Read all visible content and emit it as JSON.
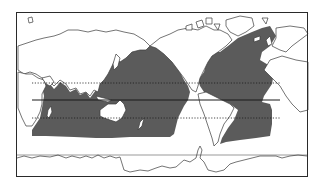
{
  "map": {
    "projection": "equirectangular world map, Pacific-centered",
    "frame": {
      "x": 16,
      "y": 12,
      "width": 292,
      "height": 165
    },
    "colors": {
      "background": "#ffffff",
      "land_fill": "#ffffff",
      "coastline": "#3a3a3a",
      "shaded_ocean": "#5a5a5a",
      "frame": "#2a2a2a",
      "lines": "#1a1a1a"
    },
    "lines": [
      {
        "name": "tropic-of-cancer",
        "style": "dotted",
        "y": 83
      },
      {
        "name": "equator",
        "style": "solid",
        "y": 100
      },
      {
        "name": "tropic-of-capricorn",
        "style": "dotted",
        "y": 118
      },
      {
        "name": "antarctic-reference",
        "style": "solid-thin",
        "y": 155
      }
    ],
    "shaded_region": "tropical and subtropical oceans (Indian, Pacific, Atlantic)",
    "labels": []
  }
}
